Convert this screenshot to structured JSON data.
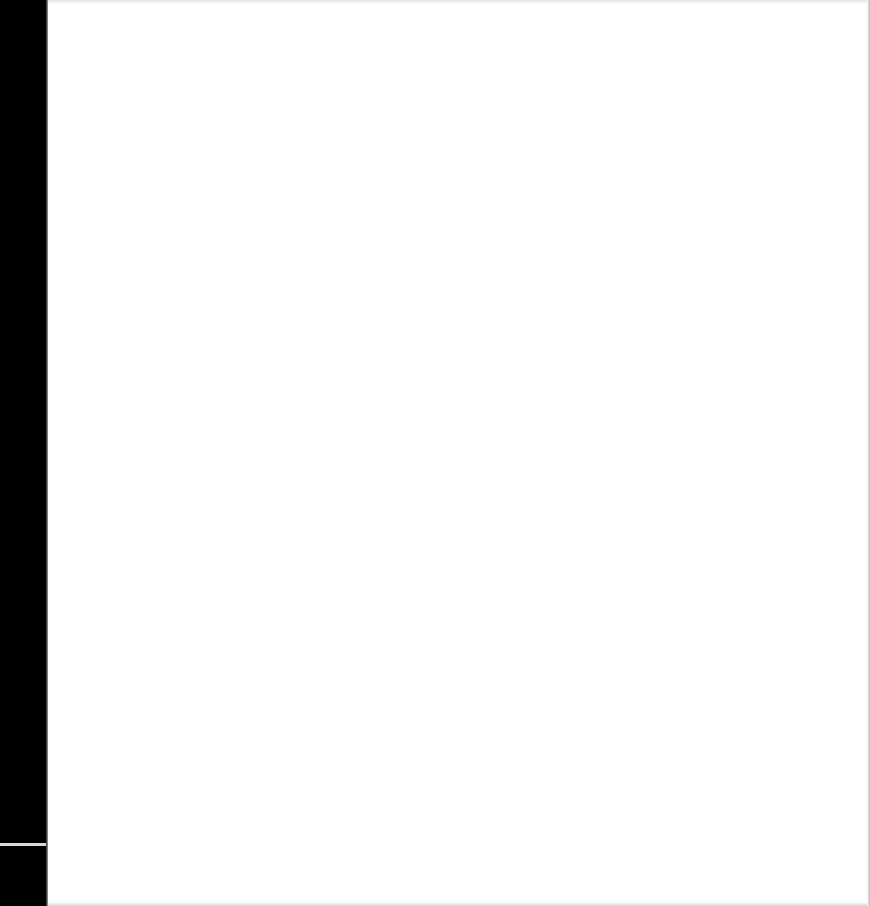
{
  "page": {
    "content": "",
    "background_color": "#ffffff",
    "left_strip_color": "#000000"
  }
}
